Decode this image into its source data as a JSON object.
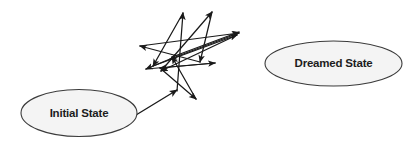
{
  "canvas": {
    "width": 407,
    "height": 146,
    "background": "#ffffff"
  },
  "style": {
    "node_fill": "#f4f4f4",
    "node_stroke": "#3b3b3b",
    "edge_color": "#1a1a1a",
    "label_color": "#1d1d1d"
  },
  "nodes": [
    {
      "id": "initial-state",
      "label": "Initial State",
      "cx": 79,
      "cy": 113,
      "rx": 58,
      "ry": 23.5
    },
    {
      "id": "dreamed-state",
      "label": "Dreamed State",
      "cx": 333.5,
      "cy": 63.5,
      "rx": 68.5,
      "ry": 22.5
    }
  ],
  "entry_edge": {
    "id": "initial-to-walk",
    "from": "initial-state",
    "to": "random-walk",
    "x1": 136,
    "y1": 115,
    "x2": 177,
    "y2": 90,
    "arrowheads": "end"
  },
  "random_walk": {
    "id": "random-walk",
    "description": "tangled exploratory search path between initial and dreamed state",
    "segments": [
      {
        "x1": 177,
        "y1": 91,
        "x2": 183,
        "y2": 13,
        "arrowheads": "end"
      },
      {
        "x1": 183,
        "y1": 13,
        "x2": 153,
        "y2": 66,
        "arrowheads": "end"
      },
      {
        "x1": 153,
        "y1": 66,
        "x2": 237,
        "y2": 35,
        "arrowheads": "end"
      },
      {
        "x1": 237,
        "y1": 35,
        "x2": 161,
        "y2": 71,
        "arrowheads": "end"
      },
      {
        "x1": 161,
        "y1": 71,
        "x2": 212,
        "y2": 12,
        "arrowheads": "end"
      },
      {
        "x1": 212,
        "y1": 12,
        "x2": 200,
        "y2": 62,
        "arrowheads": "end"
      },
      {
        "x1": 200,
        "y1": 62,
        "x2": 140,
        "y2": 46,
        "arrowheads": "end"
      },
      {
        "x1": 140,
        "y1": 46,
        "x2": 239,
        "y2": 33,
        "arrowheads": "end"
      },
      {
        "x1": 239,
        "y1": 33,
        "x2": 170,
        "y2": 59,
        "arrowheads": "end"
      },
      {
        "x1": 170,
        "y1": 59,
        "x2": 146,
        "y2": 69,
        "arrowheads": "end"
      },
      {
        "x1": 146,
        "y1": 69,
        "x2": 215,
        "y2": 63,
        "arrowheads": "end"
      },
      {
        "x1": 215,
        "y1": 63,
        "x2": 160,
        "y2": 68,
        "arrowheads": "end"
      },
      {
        "x1": 160,
        "y1": 68,
        "x2": 196,
        "y2": 99,
        "arrowheads": "end"
      },
      {
        "x1": 196,
        "y1": 99,
        "x2": 172,
        "y2": 57,
        "arrowheads": "end"
      },
      {
        "x1": 172,
        "y1": 57,
        "x2": 239,
        "y2": 32,
        "arrowheads": "end"
      }
    ]
  },
  "a11y": {
    "alt": "Diagram showing an Initial State ellipse connected by an arrow to a tangle of arrows, with a separate Dreamed State ellipse at the right."
  }
}
